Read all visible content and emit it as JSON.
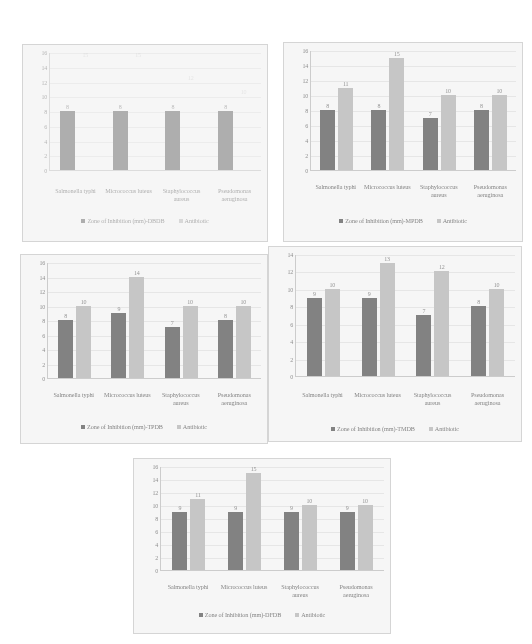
{
  "page": {
    "background": "#ffffff",
    "series_colors": {
      "treatment": "#7a7a7a",
      "antibiotic": "#c8c8c8"
    }
  },
  "charts": [
    {
      "id": "chart-dbdb",
      "type": "bar",
      "title": "",
      "xlabel": "",
      "ylabel": "",
      "ylim": [
        0,
        16
      ],
      "yticks": [
        0,
        2,
        4,
        6,
        8,
        10,
        12,
        14,
        16
      ],
      "grid": true,
      "legend_position": "bottom",
      "categories": [
        "Salmonella typhi",
        "Micrococcus luteus",
        "Staphylococcus aureus",
        "Pseudomonas aeruginosa"
      ],
      "series": [
        {
          "name": "Zone of Inhibition (mm)-DBDB",
          "values": [
            8,
            8,
            8,
            8
          ]
        },
        {
          "name": "Antibiotic",
          "values": [
            15,
            15,
            12,
            10
          ]
        }
      ]
    },
    {
      "id": "chart-mpdb",
      "type": "bar",
      "title": "",
      "xlabel": "",
      "ylabel": "",
      "ylim": [
        0,
        16
      ],
      "yticks": [
        0,
        2,
        4,
        6,
        8,
        10,
        12,
        14,
        16
      ],
      "grid": true,
      "legend_position": "bottom",
      "categories": [
        "Salmonella typhi",
        "Micrococcus luteus",
        "Staphylococcus aureus",
        "Pseudomonas aeruginosa"
      ],
      "series": [
        {
          "name": "Zone of Inhibition (mm)-MPDB",
          "values": [
            8,
            8,
            7,
            8
          ]
        },
        {
          "name": "Antibiotic",
          "values": [
            11,
            15,
            10,
            10
          ]
        }
      ]
    },
    {
      "id": "chart-tpdb",
      "type": "bar",
      "title": "",
      "xlabel": "",
      "ylabel": "",
      "ylim": [
        0,
        16
      ],
      "yticks": [
        0,
        2,
        4,
        6,
        8,
        10,
        12,
        14,
        16
      ],
      "grid": true,
      "legend_position": "bottom",
      "categories": [
        "Salmonella typhi",
        "Micrococcus luteus",
        "Staphylococcus aureus",
        "Pseudomonas aeruginosa"
      ],
      "series": [
        {
          "name": "Zone of Inhibition (mm)-TPDB",
          "values": [
            8,
            9,
            7,
            8
          ]
        },
        {
          "name": "Antibiotic",
          "values": [
            10,
            14,
            10,
            10
          ]
        }
      ]
    },
    {
      "id": "chart-tmdb",
      "type": "bar",
      "title": "",
      "xlabel": "",
      "ylabel": "",
      "ylim": [
        0,
        14
      ],
      "yticks": [
        0,
        2,
        4,
        6,
        8,
        10,
        12,
        14
      ],
      "grid": true,
      "legend_position": "bottom",
      "categories": [
        "Salmonella typhi",
        "Micrococcus luteus",
        "Staphylococcus aureus",
        "Pseudomonas aeruginosa"
      ],
      "series": [
        {
          "name": "Zone of Inhibition (mm)-TMDB",
          "values": [
            9,
            9,
            7,
            8
          ]
        },
        {
          "name": "Antibiotic",
          "values": [
            10,
            13,
            12,
            10
          ]
        }
      ]
    },
    {
      "id": "chart-dfdb",
      "type": "bar",
      "title": "",
      "xlabel": "",
      "ylabel": "",
      "ylim": [
        0,
        16
      ],
      "yticks": [
        0,
        2,
        4,
        6,
        8,
        10,
        12,
        14,
        16
      ],
      "grid": true,
      "legend_position": "bottom",
      "categories": [
        "Salmonella typhi",
        "Micrococcus luteus",
        "Staphylococcus aureus",
        "Pseudomonas aeruginosa"
      ],
      "series": [
        {
          "name": "Zone of Inhibition (mm)-DFDB",
          "values": [
            9,
            9,
            9,
            9
          ]
        },
        {
          "name": "Antibiotic",
          "values": [
            11,
            15,
            10,
            10
          ]
        }
      ]
    }
  ],
  "chart_data": [
    {
      "type": "bar",
      "title": "Zone of Inhibition - DBDB vs Antibiotic",
      "xlabel": "",
      "ylabel": "",
      "ylim": [
        0,
        16
      ],
      "grid": true,
      "legend_position": "bottom",
      "categories": [
        "Salmonella typhi",
        "Micrococcus luteus",
        "Staphylococcus aureus",
        "Pseudomonas aeruginosa"
      ],
      "series": [
        {
          "name": "Zone of Inhibition (mm)-DBDB",
          "values": [
            8,
            8,
            8,
            8
          ]
        },
        {
          "name": "Antibiotic",
          "values": [
            15,
            15,
            12,
            10
          ]
        }
      ]
    },
    {
      "type": "bar",
      "title": "Zone of Inhibition - MPDB vs Antibiotic",
      "xlabel": "",
      "ylabel": "",
      "ylim": [
        0,
        16
      ],
      "grid": true,
      "legend_position": "bottom",
      "categories": [
        "Salmonella typhi",
        "Micrococcus luteus",
        "Staphylococcus aureus",
        "Pseudomonas aeruginosa"
      ],
      "series": [
        {
          "name": "Zone of Inhibition (mm)-MPDB",
          "values": [
            8,
            8,
            7,
            8
          ]
        },
        {
          "name": "Antibiotic",
          "values": [
            11,
            15,
            10,
            10
          ]
        }
      ]
    },
    {
      "type": "bar",
      "title": "Zone of Inhibition - TPDB vs Antibiotic",
      "xlabel": "",
      "ylabel": "",
      "ylim": [
        0,
        16
      ],
      "grid": true,
      "legend_position": "bottom",
      "categories": [
        "Salmonella typhi",
        "Micrococcus luteus",
        "Staphylococcus aureus",
        "Pseudomonas aeruginosa"
      ],
      "series": [
        {
          "name": "Zone of Inhibition (mm)-TPDB",
          "values": [
            8,
            9,
            7,
            8
          ]
        },
        {
          "name": "Antibiotic",
          "values": [
            10,
            14,
            10,
            10
          ]
        }
      ]
    },
    {
      "type": "bar",
      "title": "Zone of Inhibition - TMDB vs Antibiotic",
      "xlabel": "",
      "ylabel": "",
      "ylim": [
        0,
        14
      ],
      "grid": true,
      "legend_position": "bottom",
      "categories": [
        "Salmonella typhi",
        "Micrococcus luteus",
        "Staphylococcus aureus",
        "Pseudomonas aeruginosa"
      ],
      "series": [
        {
          "name": "Zone of Inhibition (mm)-TMDB",
          "values": [
            9,
            9,
            7,
            8
          ]
        },
        {
          "name": "Antibiotic",
          "values": [
            10,
            13,
            12,
            10
          ]
        }
      ]
    },
    {
      "type": "bar",
      "title": "Zone of Inhibition - DFDB vs Antibiotic",
      "xlabel": "",
      "ylabel": "",
      "ylim": [
        0,
        16
      ],
      "grid": true,
      "legend_position": "bottom",
      "categories": [
        "Salmonella typhi",
        "Micrococcus luteus",
        "Staphylococcus aureus",
        "Pseudomonas aeruginosa"
      ],
      "series": [
        {
          "name": "Zone of Inhibition (mm)-DFDB",
          "values": [
            9,
            9,
            9,
            9
          ]
        },
        {
          "name": "Antibiotic",
          "values": [
            11,
            15,
            10,
            10
          ]
        }
      ]
    }
  ]
}
